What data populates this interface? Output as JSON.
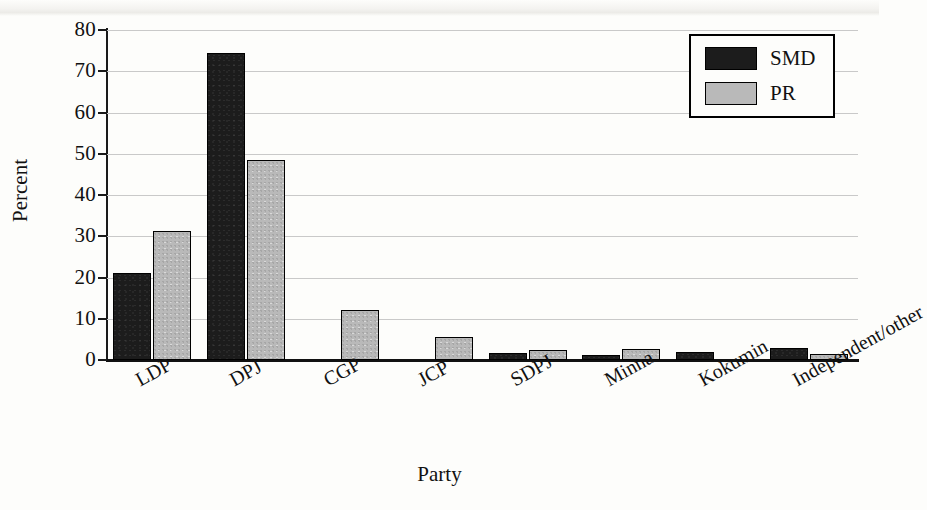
{
  "chart_data": {
    "type": "bar",
    "title": "",
    "xlabel": "Party",
    "ylabel": "Percent",
    "ylim": [
      0,
      80
    ],
    "yticks": [
      0,
      10,
      20,
      30,
      40,
      50,
      60,
      70,
      80
    ],
    "ytick_labels": [
      "0",
      "10",
      "20",
      "30",
      "40",
      "50",
      "60",
      "70",
      "80"
    ],
    "grid": true,
    "legend_position": "top-right",
    "categories": [
      "LDP",
      "DPJ",
      "CGP",
      "JCP",
      "SDPJ",
      "Minna",
      "Kokumin",
      "Independent/other"
    ],
    "series": [
      {
        "name": "SMD",
        "color": "#1c1c1c",
        "values": [
          21.2,
          74.4,
          0,
          0,
          1.7,
          1.2,
          1.9,
          2.8
        ]
      },
      {
        "name": "PR",
        "color": "#b9b9b9",
        "values": [
          31.3,
          48.5,
          12.1,
          5.5,
          2.5,
          2.7,
          0,
          1.5
        ]
      }
    ]
  },
  "legend": {
    "items": [
      {
        "label": "SMD",
        "swatch": "black-square"
      },
      {
        "label": "PR",
        "swatch": "gray-square"
      }
    ]
  },
  "axes": {
    "y_title": "Percent",
    "x_title": "Party"
  }
}
